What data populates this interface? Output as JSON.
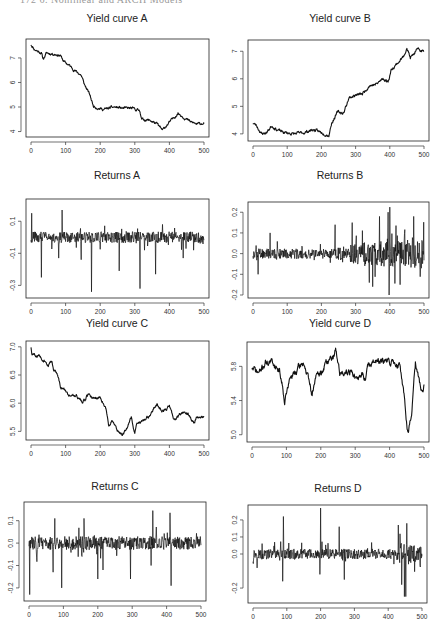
{
  "page": {
    "header": "172   6. Nonlinear and ARCH Models"
  },
  "chart_data": [
    {
      "id": "yieldA",
      "type": "line",
      "title": "Yield curve A",
      "xlabel": "",
      "ylabel": "",
      "xlim": [
        0,
        500
      ],
      "ylim": [
        3.9,
        7.65
      ],
      "xticks": [
        0,
        100,
        200,
        300,
        400,
        500
      ],
      "yticks": [
        4,
        5,
        6,
        7
      ],
      "ytick_labels": [
        "4",
        "5",
        "6",
        "7"
      ],
      "box": {
        "left": 26,
        "top": 39,
        "right": 209,
        "bottom": 137
      },
      "title_pos": {
        "x": 117,
        "y": 18
      },
      "kind": "level",
      "noise": 0.04,
      "seed": 11,
      "anchors": [
        [
          0,
          7.55
        ],
        [
          10,
          7.35
        ],
        [
          30,
          7.2
        ],
        [
          35,
          6.95
        ],
        [
          45,
          7.2
        ],
        [
          70,
          7.15
        ],
        [
          85,
          7.1
        ],
        [
          95,
          6.85
        ],
        [
          110,
          6.7
        ],
        [
          130,
          6.45
        ],
        [
          145,
          6.3
        ],
        [
          155,
          5.9
        ],
        [
          170,
          5.5
        ],
        [
          180,
          5.05
        ],
        [
          195,
          4.95
        ],
        [
          210,
          4.9
        ],
        [
          240,
          5.0
        ],
        [
          265,
          4.95
        ],
        [
          290,
          4.95
        ],
        [
          315,
          4.85
        ],
        [
          320,
          4.5
        ],
        [
          345,
          4.45
        ],
        [
          365,
          4.3
        ],
        [
          380,
          4.05
        ],
        [
          395,
          4.3
        ],
        [
          425,
          4.75
        ],
        [
          440,
          4.6
        ],
        [
          460,
          4.4
        ],
        [
          480,
          4.3
        ],
        [
          500,
          4.35
        ]
      ]
    },
    {
      "id": "yieldB",
      "type": "line",
      "title": "Yield curve B",
      "xlabel": "",
      "ylabel": "",
      "xlim": [
        0,
        500
      ],
      "ylim": [
        3.85,
        7.3
      ],
      "xticks": [
        0,
        100,
        200,
        300,
        400,
        500
      ],
      "yticks": [
        4,
        5,
        6,
        7
      ],
      "ytick_labels": [
        "4",
        "5",
        "6",
        "7"
      ],
      "box": {
        "left": 248,
        "top": 40,
        "right": 429,
        "bottom": 141
      },
      "title_pos": {
        "x": 340,
        "y": 18
      },
      "kind": "level",
      "noise": 0.04,
      "seed": 23,
      "anchors": [
        [
          0,
          4.4
        ],
        [
          10,
          4.3
        ],
        [
          25,
          4.0
        ],
        [
          40,
          4.05
        ],
        [
          55,
          4.3
        ],
        [
          70,
          4.15
        ],
        [
          90,
          4.05
        ],
        [
          120,
          4.0
        ],
        [
          150,
          4.05
        ],
        [
          175,
          4.15
        ],
        [
          200,
          4.05
        ],
        [
          222,
          3.95
        ],
        [
          230,
          4.4
        ],
        [
          248,
          4.8
        ],
        [
          265,
          4.75
        ],
        [
          280,
          5.3
        ],
        [
          298,
          5.4
        ],
        [
          320,
          5.45
        ],
        [
          340,
          5.75
        ],
        [
          360,
          5.8
        ],
        [
          380,
          6.0
        ],
        [
          395,
          5.9
        ],
        [
          405,
          6.35
        ],
        [
          425,
          6.6
        ],
        [
          440,
          6.8
        ],
        [
          450,
          7.15
        ],
        [
          460,
          6.75
        ],
        [
          480,
          7.05
        ],
        [
          500,
          7.0
        ]
      ]
    },
    {
      "id": "returnsA",
      "type": "line",
      "title": "Returns A",
      "xlabel": "",
      "ylabel": "",
      "xlim": [
        0,
        500
      ],
      "ylim": [
        -0.36,
        0.22
      ],
      "xticks": [
        0,
        100,
        200,
        300,
        400,
        500
      ],
      "yticks": [
        0.1,
        -0.1,
        -0.3
      ],
      "ytick_labels": [
        "0.1",
        "-0.1",
        "-0.3"
      ],
      "box": {
        "left": 26,
        "top": 199,
        "right": 209,
        "bottom": 298
      },
      "title_pos": {
        "x": 117,
        "y": 175
      },
      "kind": "returns",
      "base": 0.0,
      "amp": 0.035,
      "seed": 31,
      "spikes": [
        [
          2,
          0.15
        ],
        [
          30,
          -0.25
        ],
        [
          90,
          0.17
        ],
        [
          80,
          -0.13
        ],
        [
          145,
          -0.14
        ],
        [
          175,
          -0.34
        ],
        [
          255,
          -0.21
        ],
        [
          315,
          -0.32
        ],
        [
          360,
          -0.23
        ],
        [
          440,
          -0.13
        ],
        [
          380,
          0.08
        ]
      ]
    },
    {
      "id": "returnsB",
      "type": "line",
      "title": "Returns B",
      "xlabel": "",
      "ylabel": "",
      "xlim": [
        0,
        500
      ],
      "ylim": [
        -0.2,
        0.235
      ],
      "xticks": [
        0,
        100,
        200,
        300,
        400,
        500
      ],
      "yticks": [
        0.2,
        0.1,
        0.0,
        -0.1,
        -0.2
      ],
      "ytick_labels": [
        "0.2",
        "0.1",
        "0.0",
        "-0.1",
        "-0.2"
      ],
      "box": {
        "left": 248,
        "top": 202,
        "right": 429,
        "bottom": 298
      },
      "title_pos": {
        "x": 340,
        "y": 175
      },
      "kind": "returns",
      "base": 0.0,
      "amp": 0.03,
      "seed": 47,
      "ampRamp": [
        [
          0,
          0.8
        ],
        [
          240,
          0.8
        ],
        [
          300,
          1.8
        ],
        [
          500,
          2.4
        ]
      ],
      "spikes": [
        [
          15,
          -0.1
        ],
        [
          50,
          0.1
        ],
        [
          240,
          0.14
        ],
        [
          290,
          0.15
        ],
        [
          370,
          0.18
        ],
        [
          340,
          -0.14
        ],
        [
          350,
          -0.16
        ],
        [
          395,
          0.2
        ],
        [
          400,
          0.225
        ],
        [
          398,
          -0.2
        ],
        [
          430,
          -0.15
        ],
        [
          470,
          0.18
        ]
      ]
    },
    {
      "id": "yieldC",
      "type": "line",
      "title": "Yield curve C",
      "xlabel": "",
      "ylabel": "",
      "xlim": [
        0,
        500
      ],
      "ylim": [
        5.4,
        7.05
      ],
      "xticks": [
        0,
        100,
        200,
        300,
        400,
        500
      ],
      "yticks": [
        5.5,
        6.0,
        6.5,
        7.0
      ],
      "ytick_labels": [
        "5.5",
        "6.0",
        "6.5",
        "7.0"
      ],
      "box": {
        "left": 26,
        "top": 341,
        "right": 209,
        "bottom": 440
      },
      "title_pos": {
        "x": 117,
        "y": 323
      },
      "kind": "level",
      "noise": 0.02,
      "seed": 59,
      "anchors": [
        [
          0,
          7.0
        ],
        [
          3,
          6.85
        ],
        [
          20,
          6.85
        ],
        [
          40,
          6.75
        ],
        [
          50,
          6.65
        ],
        [
          60,
          6.75
        ],
        [
          65,
          6.6
        ],
        [
          75,
          6.55
        ],
        [
          85,
          6.3
        ],
        [
          95,
          6.25
        ],
        [
          105,
          6.15
        ],
        [
          130,
          6.15
        ],
        [
          150,
          6.0
        ],
        [
          165,
          6.15
        ],
        [
          180,
          6.1
        ],
        [
          200,
          6.1
        ],
        [
          215,
          5.95
        ],
        [
          225,
          5.6
        ],
        [
          235,
          5.7
        ],
        [
          250,
          5.5
        ],
        [
          265,
          5.45
        ],
        [
          280,
          5.6
        ],
        [
          290,
          5.75
        ],
        [
          300,
          5.45
        ],
        [
          305,
          5.65
        ],
        [
          330,
          5.7
        ],
        [
          350,
          5.85
        ],
        [
          365,
          6.0
        ],
        [
          380,
          5.85
        ],
        [
          390,
          5.9
        ],
        [
          400,
          5.95
        ],
        [
          415,
          5.7
        ],
        [
          430,
          5.8
        ],
        [
          450,
          5.85
        ],
        [
          470,
          5.65
        ],
        [
          480,
          5.75
        ],
        [
          500,
          5.75
        ]
      ]
    },
    {
      "id": "yieldD",
      "type": "line",
      "title": "Yield curve D",
      "xlabel": "",
      "ylabel": "",
      "xlim": [
        0,
        500
      ],
      "ylim": [
        4.95,
        6.05
      ],
      "xticks": [
        0,
        100,
        200,
        300,
        400,
        500
      ],
      "yticks": [
        5.0,
        5.4,
        5.8
      ],
      "ytick_labels": [
        "5.0",
        "5.4",
        "5.8"
      ],
      "box": {
        "left": 247,
        "top": 342,
        "right": 429,
        "bottom": 442
      },
      "title_pos": {
        "x": 340,
        "y": 323
      },
      "kind": "level",
      "noise": 0.03,
      "seed": 71,
      "anchors": [
        [
          0,
          5.78
        ],
        [
          20,
          5.72
        ],
        [
          40,
          5.85
        ],
        [
          60,
          5.85
        ],
        [
          80,
          5.75
        ],
        [
          90,
          5.55
        ],
        [
          95,
          5.4
        ],
        [
          110,
          5.65
        ],
        [
          130,
          5.75
        ],
        [
          150,
          5.85
        ],
        [
          170,
          5.55
        ],
        [
          175,
          5.45
        ],
        [
          185,
          5.7
        ],
        [
          200,
          5.7
        ],
        [
          215,
          5.85
        ],
        [
          235,
          5.9
        ],
        [
          245,
          6.0
        ],
        [
          255,
          5.7
        ],
        [
          270,
          5.75
        ],
        [
          290,
          5.75
        ],
        [
          305,
          5.62
        ],
        [
          320,
          5.72
        ],
        [
          330,
          5.65
        ],
        [
          340,
          5.85
        ],
        [
          360,
          5.85
        ],
        [
          380,
          5.85
        ],
        [
          410,
          5.85
        ],
        [
          430,
          5.8
        ],
        [
          440,
          5.55
        ],
        [
          450,
          5.15
        ],
        [
          455,
          5.0
        ],
        [
          465,
          5.3
        ],
        [
          475,
          5.82
        ],
        [
          485,
          5.65
        ],
        [
          495,
          5.45
        ],
        [
          500,
          5.55
        ]
      ]
    },
    {
      "id": "returnsC",
      "type": "line",
      "title": "Returns C",
      "xlabel": "",
      "ylabel": "",
      "xlim": [
        0,
        500
      ],
      "ylim": [
        -0.245,
        0.17
      ],
      "xticks": [
        0,
        100,
        200,
        300,
        400,
        500
      ],
      "yticks": [
        0.1,
        0.0,
        -0.1,
        -0.2
      ],
      "ytick_labels": [
        "0.1",
        "0.0",
        "-0.1",
        "-0.2"
      ],
      "box": {
        "left": 24,
        "top": 502,
        "right": 206,
        "bottom": 601
      },
      "title_pos": {
        "x": 115,
        "y": 486
      },
      "kind": "returns",
      "base": 0.0,
      "amp": 0.03,
      "seed": 83,
      "spikes": [
        [
          2,
          -0.23
        ],
        [
          70,
          -0.13
        ],
        [
          75,
          0.11
        ],
        [
          95,
          -0.2
        ],
        [
          160,
          0.11
        ],
        [
          200,
          -0.16
        ],
        [
          215,
          -0.12
        ],
        [
          295,
          -0.16
        ],
        [
          355,
          -0.1
        ],
        [
          360,
          0.145
        ],
        [
          410,
          0.135
        ],
        [
          413,
          -0.19
        ]
      ]
    },
    {
      "id": "returnsD",
      "type": "line",
      "title": "Returns D",
      "xlabel": "",
      "ylabel": "",
      "xlim": [
        0,
        500
      ],
      "ylim": [
        -0.27,
        0.27
      ],
      "xticks": [
        0,
        100,
        200,
        300,
        400,
        500
      ],
      "yticks": [
        0.2,
        0.1,
        0.0,
        -0.2
      ],
      "ytick_labels": [
        "0.2",
        "0.1",
        "0.0",
        "-0.2"
      ],
      "box": {
        "left": 248,
        "top": 505,
        "right": 427,
        "bottom": 603
      },
      "title_pos": {
        "x": 338,
        "y": 488
      },
      "kind": "returns",
      "base": 0.0,
      "amp": 0.03,
      "seed": 97,
      "ampRamp": [
        [
          0,
          1.0
        ],
        [
          420,
          1.0
        ],
        [
          440,
          2.2
        ],
        [
          460,
          2.0
        ],
        [
          500,
          1.2
        ]
      ],
      "spikes": [
        [
          90,
          0.22
        ],
        [
          88,
          -0.16
        ],
        [
          200,
          0.27
        ],
        [
          198,
          -0.12
        ],
        [
          255,
          0.16
        ],
        [
          270,
          -0.15
        ],
        [
          430,
          0.17
        ],
        [
          440,
          -0.18
        ],
        [
          448,
          -0.25
        ],
        [
          452,
          -0.25
        ],
        [
          455,
          0.18
        ]
      ]
    }
  ]
}
